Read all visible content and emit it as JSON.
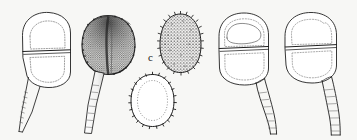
{
  "plate": {
    "title": "Teliospore illustration plate",
    "caption_label": "c",
    "background_color": "#f7f7f5",
    "ink_color": "#1a1a1a",
    "width": 357,
    "height": 140,
    "technique": "pen-and-ink stipple line drawing",
    "subject": "two-celled pedicellate teliospores with detached spore views"
  },
  "labels": [
    {
      "id": "c",
      "text": "c",
      "x": 148,
      "y": 52
    }
  ],
  "specimens": [
    {
      "id": "spore-1",
      "name": "pedicellate-teliospore-outline-left",
      "position": "far-left",
      "cells": 2,
      "shading": "outline-only",
      "wall": "smooth",
      "pedicel": "long tapering pointed",
      "septum": "transverse median",
      "center_x": 45,
      "center_y": 48
    },
    {
      "id": "spore-2",
      "name": "pedicellate-teliospore-stippled-dark",
      "position": "left-center",
      "cells": 2,
      "shading": "dense stipple, dark apex",
      "wall": "verrucose",
      "pedicel": "long tapering",
      "septum": "longitudinal median",
      "center_x": 107,
      "center_y": 45
    },
    {
      "id": "spore-3",
      "name": "detached-spore-echinulate-upper",
      "position": "center-upper",
      "cells": 1,
      "shading": "dense warted stipple",
      "wall": "echinulate",
      "pedicel": "none",
      "septum": "none",
      "center_x": 180,
      "center_y": 42
    },
    {
      "id": "spore-4",
      "name": "detached-spore-outline-lower",
      "position": "center-lower",
      "cells": 1,
      "shading": "outline-only",
      "wall": "warted margin",
      "pedicel": "none",
      "septum": "none",
      "center_x": 152,
      "center_y": 100
    },
    {
      "id": "spore-5",
      "name": "pedicellate-teliospore-outline-right-inner",
      "position": "right-center",
      "cells": 2,
      "shading": "outline-only",
      "wall": "smooth",
      "pedicel": "long curved",
      "septum": "transverse median",
      "center_x": 246,
      "center_y": 46
    },
    {
      "id": "spore-6",
      "name": "pedicellate-teliospore-outline-far-right",
      "position": "far-right",
      "cells": 2,
      "shading": "outline-only",
      "wall": "smooth",
      "pedicel": "long tapering",
      "septum": "transverse median",
      "center_x": 312,
      "center_y": 44
    }
  ]
}
